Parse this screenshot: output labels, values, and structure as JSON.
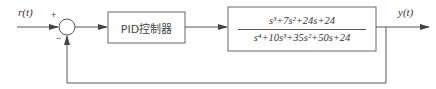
{
  "diagram": {
    "type": "closed-loop control block diagram",
    "input_label": "r(t)",
    "output_label": "y(t)",
    "summing_junction": {
      "plus_sign": "+",
      "minus_sign": "−"
    },
    "controller": {
      "label": "PID控制器"
    },
    "plant": {
      "numerator": "s³+7s²+24s+24",
      "denominator": "s⁴+10s³+35s²+50s+24"
    },
    "feedback": "unity negative feedback",
    "colors": {
      "line": "#555555",
      "text": "#333333",
      "background": "#ffffff"
    }
  }
}
